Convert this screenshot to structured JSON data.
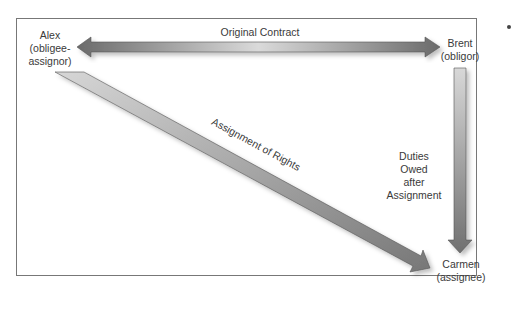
{
  "diagram": {
    "parties": {
      "alex": {
        "name": "Alex",
        "role": "(obligee-",
        "role2": "assignor)"
      },
      "brent": {
        "name": "Brent",
        "role": "(obligor)"
      },
      "carmen": {
        "name": "Carmen",
        "role": "(assignee)"
      }
    },
    "arrows": {
      "original_contract": "Original Contract",
      "assignment_of_rights": "Assignment of Rights",
      "duties": [
        "Duties",
        "Owed",
        "after",
        "Assignment"
      ]
    },
    "colors": {
      "arrow_dark": "#6e6e6e",
      "arrow_light": "#d4d4d4",
      "border": "#777777"
    }
  }
}
